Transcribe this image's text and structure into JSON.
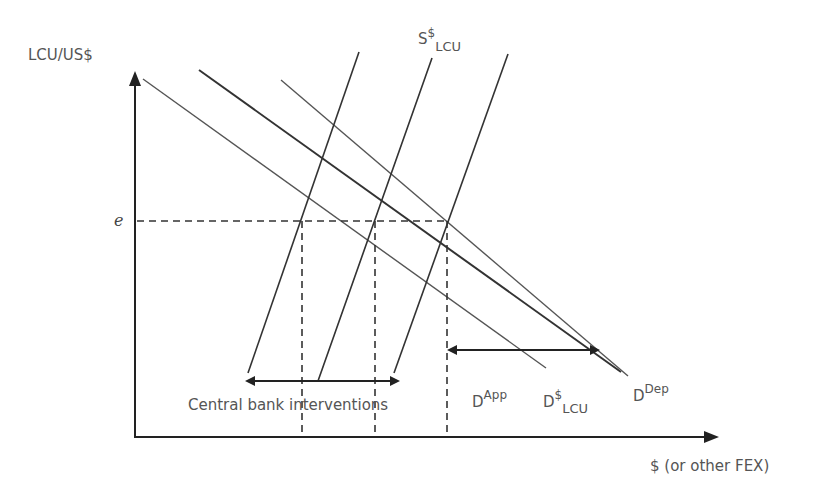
{
  "diagram": {
    "y_axis_label": "LCU/US$",
    "x_axis_label": "$ (or other FEX)",
    "equilibrium_label": "e",
    "supply_curve": {
      "base": "S",
      "sup": "$",
      "sub": "LCU"
    },
    "demand_curves": [
      {
        "id": "app",
        "base": "D",
        "sup": "App",
        "sub": ""
      },
      {
        "id": "lcu",
        "base": "D",
        "sup": "$",
        "sub": "LCU"
      },
      {
        "id": "dep",
        "base": "D",
        "sup": "Dep",
        "sub": ""
      }
    ],
    "intervention_label": "Central bank interventions",
    "colors": {
      "line": "#333333",
      "thin_line": "#555555",
      "text": "#555555"
    }
  }
}
